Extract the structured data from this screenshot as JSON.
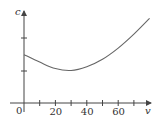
{
  "chart_data": {
    "type": "line",
    "title": "",
    "xlabel": "v",
    "ylabel": "c",
    "origin_label": "0",
    "x_ticks": [
      10,
      20,
      30,
      40,
      50,
      60,
      70
    ],
    "x_tick_labels": [
      "20",
      "40",
      "60"
    ],
    "x_tick_label_values": [
      20,
      40,
      60
    ],
    "y_ticks_px_count": 2,
    "xlim": [
      0,
      80
    ],
    "grid": false,
    "legend": null,
    "series": [
      {
        "name": "c(v)",
        "x": [
          0,
          10,
          20,
          30,
          40,
          50,
          60,
          70,
          80
        ],
        "y_relative": [
          0.52,
          0.44,
          0.37,
          0.35,
          0.39,
          0.47,
          0.59,
          0.74,
          0.91
        ]
      }
    ],
    "annotation": "U-shaped curve with minimum near v = 30"
  },
  "colors": {
    "axis": "#444444",
    "curve": "#666666",
    "text": "#333333"
  }
}
